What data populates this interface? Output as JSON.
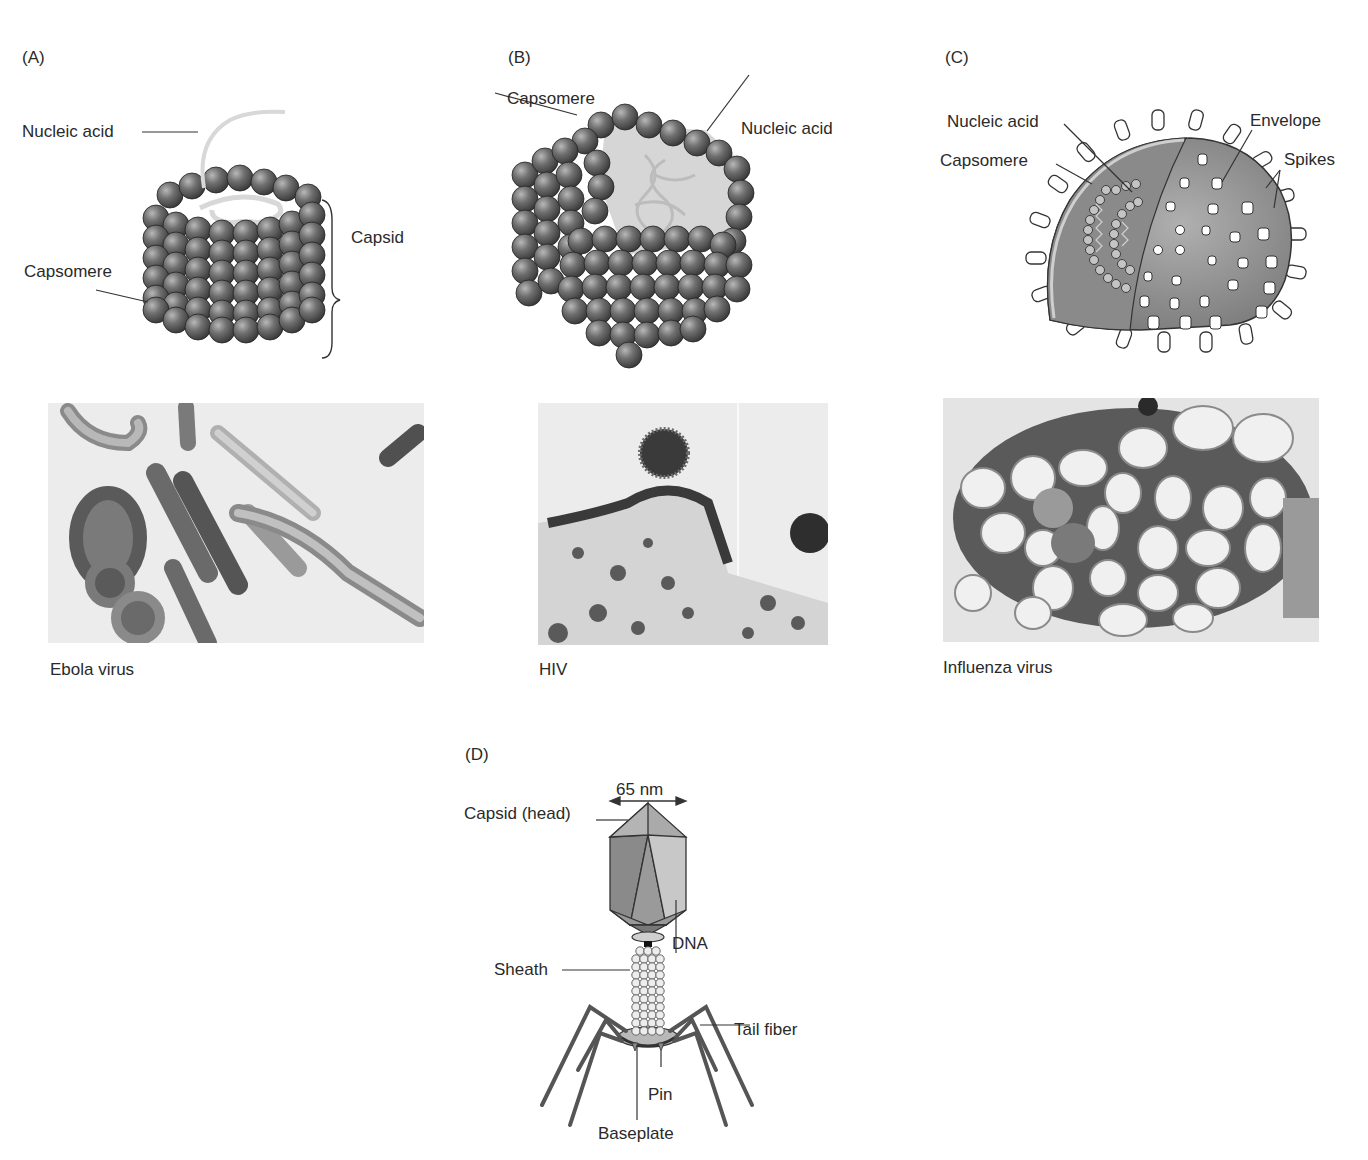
{
  "figure": {
    "panels": [
      {
        "id": "A",
        "label": "(A)",
        "type": "helical capsid diagram",
        "annotations": {
          "nucleic_acid": "Nucleic acid",
          "capsid": "Capsid",
          "capsomere": "Capsomere"
        },
        "micrograph_caption": "Ebola virus"
      },
      {
        "id": "B",
        "label": "(B)",
        "type": "icosahedral capsid diagram",
        "annotations": {
          "capsomere": "Capsomere",
          "nucleic_acid": "Nucleic acid"
        },
        "micrograph_caption": "HIV"
      },
      {
        "id": "C",
        "label": "(C)",
        "type": "enveloped virus diagram",
        "annotations": {
          "nucleic_acid": "Nucleic acid",
          "capsomere": "Capsomere",
          "envelope": "Envelope",
          "spikes": "Spikes"
        },
        "micrograph_caption": "Influenza virus"
      },
      {
        "id": "D",
        "label": "(D)",
        "type": "bacteriophage diagram",
        "annotations": {
          "dimension": "65 nm",
          "capsid_head": "Capsid (head)",
          "dna": "DNA",
          "sheath": "Sheath",
          "tail_fiber": "Tail fiber",
          "pin": "Pin",
          "baseplate": "Baseplate"
        }
      }
    ],
    "colors": {
      "sphere_dark": "#4a4a4a",
      "sphere_mid": "#7a7a7a",
      "sphere_light": "#b0b0b0",
      "envelope": "#808080",
      "micrograph_bg": "#ececec",
      "text": "#2a2a2a"
    }
  }
}
